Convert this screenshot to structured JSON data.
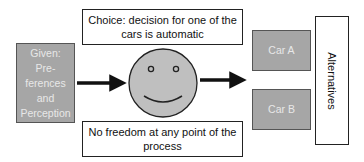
{
  "diagram": {
    "given_box": {
      "lines": [
        "Given: Pre-",
        "ferences",
        "and",
        "Perception"
      ]
    },
    "choice_box": {
      "lines": [
        "Choice: decision for one of the",
        "cars is automatic"
      ]
    },
    "constraint_box": {
      "lines": [
        "No freedom at any point of the",
        "process"
      ]
    },
    "center_icon": "smiley-face-icon",
    "options": [
      {
        "label": "Car A"
      },
      {
        "label": "Car B"
      }
    ],
    "alternatives_label": "Alternatives",
    "colors": {
      "gray_fill": "#a6a6a6",
      "face_fill": "#bfbfbf",
      "stroke": "#222222",
      "arrow": "#111111"
    }
  }
}
